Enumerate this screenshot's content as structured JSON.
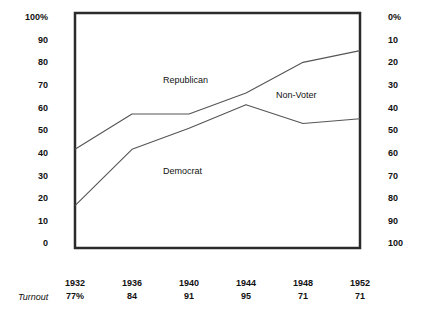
{
  "chart_data": {
    "type": "line",
    "title": "",
    "subtitle": "",
    "xlabel": "",
    "ylabel": "",
    "grid": false,
    "legend_position": "inline-annotations",
    "categories": [
      "1932",
      "1936",
      "1940",
      "1944",
      "1948",
      "1952"
    ],
    "x": [
      1932,
      1936,
      1940,
      1944,
      1948,
      1952
    ],
    "left_axis": {
      "label": "100%",
      "ticks": [
        "100%",
        "90",
        "80",
        "70",
        "60",
        "50",
        "40",
        "30",
        "20",
        "10",
        "0"
      ],
      "tick_values": [
        100,
        90,
        80,
        70,
        60,
        50,
        40,
        30,
        20,
        10,
        0
      ],
      "ylim": [
        0,
        100
      ],
      "direction": "normal"
    },
    "right_axis": {
      "label": "0%",
      "ticks": [
        "0%",
        "10",
        "20",
        "30",
        "40",
        "50",
        "60",
        "70",
        "80",
        "90",
        "100"
      ],
      "tick_values": [
        0,
        10,
        20,
        30,
        40,
        50,
        60,
        70,
        80,
        90,
        100
      ],
      "ylim": [
        0,
        100
      ],
      "direction": "inverted"
    },
    "series": [
      {
        "name": "Republican",
        "annotation": "Republican",
        "values": [
          42,
          57,
          57,
          66,
          79,
          84
        ]
      },
      {
        "name": "Democrat",
        "annotation": "Democrat",
        "values": [
          18,
          42,
          51,
          61,
          53,
          55
        ]
      }
    ],
    "annotations": [
      {
        "text": "Republican",
        "x_px": 163,
        "y_px": 75
      },
      {
        "text": "Non-Voter",
        "x_px": 276,
        "y_px": 90
      },
      {
        "text": "Democrat",
        "x_px": 163,
        "y_px": 166
      }
    ],
    "turnout": {
      "caption": "Turnout",
      "values": [
        "77%",
        "84",
        "91",
        "95",
        "71",
        "71"
      ]
    }
  },
  "left_axis_ticks": [
    {
      "label": "100%",
      "y": 17
    },
    {
      "label": "90",
      "y": 40
    },
    {
      "label": "80",
      "y": 62
    },
    {
      "label": "70",
      "y": 85
    },
    {
      "label": "60",
      "y": 108
    },
    {
      "label": "50",
      "y": 130
    },
    {
      "label": "40",
      "y": 153
    },
    {
      "label": "30",
      "y": 176
    },
    {
      "label": "20",
      "y": 198
    },
    {
      "label": "10",
      "y": 221
    },
    {
      "label": "0",
      "y": 243
    }
  ],
  "right_axis_ticks": [
    {
      "label": "0%",
      "y": 17
    },
    {
      "label": "10",
      "y": 40
    },
    {
      "label": "20",
      "y": 62
    },
    {
      "label": "30",
      "y": 85
    },
    {
      "label": "40",
      "y": 108
    },
    {
      "label": "50",
      "y": 130
    },
    {
      "label": "60",
      "y": 153
    },
    {
      "label": "70",
      "y": 176
    },
    {
      "label": "80",
      "y": 198
    },
    {
      "label": "90",
      "y": 221
    },
    {
      "label": "100",
      "y": 243
    }
  ],
  "x_columns": [
    {
      "year": "1932",
      "turnout": "77%",
      "x": 75
    },
    {
      "year": "1936",
      "turnout": "84",
      "x": 132
    },
    {
      "year": "1940",
      "turnout": "91",
      "x": 189
    },
    {
      "year": "1944",
      "turnout": "95",
      "x": 246
    },
    {
      "year": "1948",
      "turnout": "71",
      "x": 303
    },
    {
      "year": "1952",
      "turnout": "71",
      "x": 360
    }
  ],
  "colors": {
    "frame": "#2b2b2b",
    "line": "#555555",
    "text": "#111111",
    "background": "#ffffff"
  }
}
